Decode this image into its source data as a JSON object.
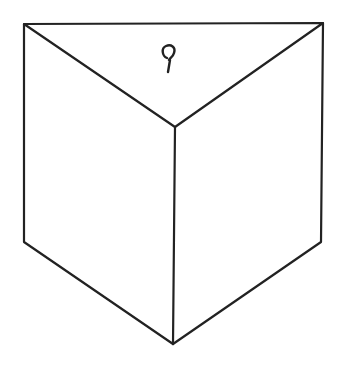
{
  "diagram": {
    "type": "line-drawing",
    "stroke_color": "#222222",
    "background": "#ffffff",
    "vertices": {
      "top_left": [
        24,
        24
      ],
      "top_right": [
        323,
        23
      ],
      "front_top": [
        175,
        127
      ],
      "bottom_left": [
        24,
        242
      ],
      "bottom_front": [
        173,
        344
      ],
      "bottom_right": [
        321,
        242
      ]
    },
    "symbol": {
      "name": "hook-loop-glyph",
      "position": [
        170,
        50
      ]
    }
  }
}
